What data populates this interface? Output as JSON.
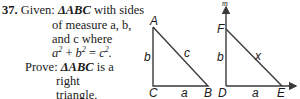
{
  "problem": {
    "number": "37.",
    "given_label": "Given:",
    "given_line1_tri": "ΔABC",
    "given_line1_rest": " with sides",
    "given_line2": "of measure a, b,",
    "given_line3": "and c where",
    "given_eq_a": "a",
    "given_eq_plus": " + ",
    "given_eq_b": "b",
    "given_eq_equals": " = ",
    "given_eq_c": "c",
    "given_eq_exp": "2",
    "given_eq_end": ".",
    "prove_label": "Prove:",
    "prove_tri": "ΔABC",
    "prove_line1_rest": " is a",
    "prove_line2": "right",
    "prove_line3": "triangle."
  },
  "figure_abc": {
    "vertices": {
      "A": "A",
      "B": "B",
      "C": "C"
    },
    "sides": {
      "CB": "a",
      "AC": "b",
      "AB": "c"
    }
  },
  "figure_def": {
    "vertices": {
      "D": "D",
      "E": "E",
      "F": "F"
    },
    "sides": {
      "DE": "a",
      "DF": "b",
      "FE": "x"
    },
    "ray_label": "m"
  },
  "colors": {
    "ink": "#1a1a1a",
    "line": "#3a3a3a"
  }
}
